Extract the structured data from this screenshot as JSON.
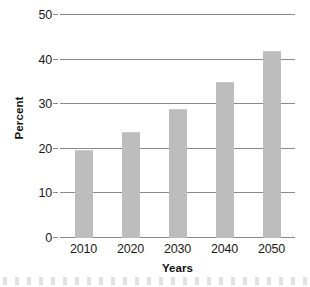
{
  "chart_data": {
    "type": "bar",
    "title": "",
    "categories": [
      "2010",
      "2020",
      "2030",
      "2040",
      "2050"
    ],
    "values": [
      19.7,
      23.8,
      29,
      35,
      42
    ],
    "xlabel": "Years",
    "ylabel": "Percent",
    "ylim": [
      0,
      50
    ],
    "yticks": [
      "0",
      "10",
      "20",
      "30",
      "40",
      "50"
    ],
    "ytick_values": [
      0,
      10,
      20,
      30,
      40,
      50
    ],
    "grid": "horizontal",
    "legend": "none",
    "bar_color": "#bdbdbd",
    "gridline_color": "#8a8a8a",
    "background_color": "#ffffff",
    "text_color": "#1a1a1a"
  },
  "axes": {
    "y_title": "Percent",
    "x_title": "Years"
  }
}
